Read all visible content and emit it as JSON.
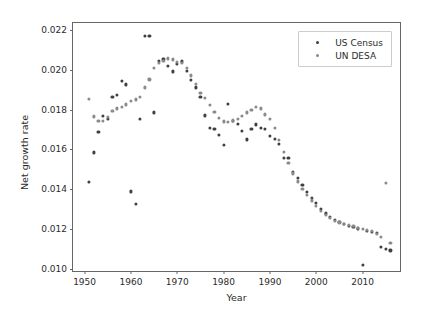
{
  "chart_data": {
    "type": "scatter",
    "title": "",
    "xlabel": "Year",
    "ylabel": "Net growth rate",
    "xlim": [
      1947.5,
      2018.5
    ],
    "ylim": [
      0.0098,
      0.02235
    ],
    "xticks": [
      1950,
      1960,
      1970,
      1980,
      1990,
      2000,
      2010
    ],
    "xticklabels": [
      "1950",
      "1960",
      "1970",
      "1980",
      "1990",
      "2000",
      "2010"
    ],
    "yticks": [
      0.01,
      0.012,
      0.014,
      0.016,
      0.018,
      0.02,
      0.022
    ],
    "yticklabels": [
      "0.010",
      "0.012",
      "0.014",
      "0.016",
      "0.018",
      "0.020",
      "0.022"
    ],
    "grid": false,
    "legend_position": "upper right",
    "series": [
      {
        "name": "US Census",
        "color": "#3f3f3f",
        "marker": "circle",
        "points": [
          [
            1951,
            0.01437
          ],
          [
            1952,
            0.01585
          ],
          [
            1953,
            0.01689
          ],
          [
            1954,
            0.0177
          ],
          [
            1955,
            0.01755
          ],
          [
            1956,
            0.01866
          ],
          [
            1957,
            0.01875
          ],
          [
            1958,
            0.01943
          ],
          [
            1959,
            0.01927
          ],
          [
            1960,
            0.0139
          ],
          [
            1961,
            0.01327
          ],
          [
            1962,
            0.01752
          ],
          [
            1963,
            0.02172
          ],
          [
            1964,
            0.02172
          ],
          [
            1965,
            0.01786
          ],
          [
            1966,
            0.02044
          ],
          [
            1967,
            0.02055
          ],
          [
            1968,
            0.02018
          ],
          [
            1969,
            0.01992
          ],
          [
            1970,
            0.0203
          ],
          [
            1971,
            0.02042
          ],
          [
            1972,
            0.01994
          ],
          [
            1973,
            0.01949
          ],
          [
            1974,
            0.01912
          ],
          [
            1975,
            0.01862
          ],
          [
            1976,
            0.01771
          ],
          [
            1977,
            0.01707
          ],
          [
            1978,
            0.01703
          ],
          [
            1979,
            0.01674
          ],
          [
            1980,
            0.01625
          ],
          [
            1981,
            0.0183
          ],
          [
            1982,
            0.01742
          ],
          [
            1983,
            0.01728
          ],
          [
            1984,
            0.01692
          ],
          [
            1985,
            0.01651
          ],
          [
            1986,
            0.01703
          ],
          [
            1987,
            0.01726
          ],
          [
            1988,
            0.0171
          ],
          [
            1989,
            0.01703
          ],
          [
            1990,
            0.0167
          ],
          [
            1991,
            0.01655
          ],
          [
            1992,
            0.01628
          ],
          [
            1993,
            0.01557
          ],
          [
            1994,
            0.01556
          ],
          [
            1995,
            0.01489
          ],
          [
            1996,
            0.01456
          ],
          [
            1997,
            0.01421
          ],
          [
            1998,
            0.01387
          ],
          [
            1999,
            0.01356
          ],
          [
            2000,
            0.0133
          ],
          [
            2001,
            0.01303
          ],
          [
            2002,
            0.01279
          ],
          [
            2003,
            0.01261
          ],
          [
            2004,
            0.01247
          ],
          [
            2005,
            0.01238
          ],
          [
            2006,
            0.01228
          ],
          [
            2007,
            0.01218
          ],
          [
            2008,
            0.01211
          ],
          [
            2009,
            0.01204
          ],
          [
            2010,
            0.01021
          ],
          [
            2011,
            0.01192
          ],
          [
            2012,
            0.01186
          ],
          [
            2013,
            0.0118
          ],
          [
            2014,
            0.01112
          ],
          [
            2015,
            0.01103
          ],
          [
            2016,
            0.01093
          ]
        ]
      },
      {
        "name": "UN DESA",
        "color": "#8a8a8a",
        "marker": "circle",
        "points": [
          [
            1951,
            0.01856
          ],
          [
            1952,
            0.01766
          ],
          [
            1953,
            0.01742
          ],
          [
            1954,
            0.01744
          ],
          [
            1955,
            0.01765
          ],
          [
            1956,
            0.01793
          ],
          [
            1957,
            0.01806
          ],
          [
            1958,
            0.01812
          ],
          [
            1959,
            0.01826
          ],
          [
            1960,
            0.01845
          ],
          [
            1961,
            0.01851
          ],
          [
            1962,
            0.01866
          ],
          [
            1963,
            0.01912
          ],
          [
            1964,
            0.01952
          ],
          [
            1965,
            0.02008
          ],
          [
            1966,
            0.02033
          ],
          [
            1967,
            0.02046
          ],
          [
            1968,
            0.02057
          ],
          [
            1969,
            0.02052
          ],
          [
            1970,
            0.0204
          ],
          [
            1971,
            0.02034
          ],
          [
            1972,
            0.0201
          ],
          [
            1973,
            0.01972
          ],
          [
            1974,
            0.01928
          ],
          [
            1975,
            0.01885
          ],
          [
            1976,
            0.01857
          ],
          [
            1977,
            0.01822
          ],
          [
            1978,
            0.01787
          ],
          [
            1979,
            0.0176
          ],
          [
            1980,
            0.01741
          ],
          [
            1981,
            0.0174
          ],
          [
            1982,
            0.01746
          ],
          [
            1983,
            0.01752
          ],
          [
            1984,
            0.01768
          ],
          [
            1985,
            0.01786
          ],
          [
            1986,
            0.018
          ],
          [
            1987,
            0.01814
          ],
          [
            1988,
            0.01806
          ],
          [
            1989,
            0.01776
          ],
          [
            1990,
            0.01752
          ],
          [
            1991,
            0.0171
          ],
          [
            1992,
            0.0165
          ],
          [
            1993,
            0.01588
          ],
          [
            1994,
            0.01531
          ],
          [
            1995,
            0.0148
          ],
          [
            1996,
            0.0144
          ],
          [
            1997,
            0.01404
          ],
          [
            1998,
            0.01371
          ],
          [
            1999,
            0.01344
          ],
          [
            2000,
            0.01318
          ],
          [
            2001,
            0.01292
          ],
          [
            2002,
            0.01272
          ],
          [
            2003,
            0.01255
          ],
          [
            2004,
            0.01243
          ],
          [
            2005,
            0.01234
          ],
          [
            2006,
            0.01227
          ],
          [
            2007,
            0.01221
          ],
          [
            2008,
            0.01215
          ],
          [
            2009,
            0.01208
          ],
          [
            2010,
            0.01201
          ],
          [
            2011,
            0.01196
          ],
          [
            2012,
            0.0119
          ],
          [
            2013,
            0.01177
          ],
          [
            2014,
            0.0116
          ],
          [
            2015,
            0.01432
          ],
          [
            2016,
            0.01133
          ]
        ]
      }
    ]
  },
  "legend": {
    "entries": [
      {
        "label": "US Census"
      },
      {
        "label": "UN DESA"
      }
    ]
  }
}
